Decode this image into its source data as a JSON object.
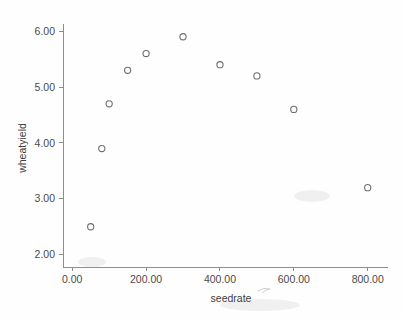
{
  "chart_data": {
    "type": "scatter",
    "title": "",
    "xlabel": "seedrate",
    "ylabel": "wheatyield",
    "x": [
      50,
      80,
      100,
      150,
      200,
      300,
      400,
      500,
      600,
      800
    ],
    "y": [
      2.5,
      3.9,
      4.7,
      5.3,
      5.6,
      5.9,
      5.4,
      5.2,
      4.6,
      3.2
    ],
    "points": [
      {
        "x": 50,
        "y": 2.5
      },
      {
        "x": 80,
        "y": 3.9
      },
      {
        "x": 100,
        "y": 4.7
      },
      {
        "x": 150,
        "y": 5.3
      },
      {
        "x": 200,
        "y": 5.6
      },
      {
        "x": 300,
        "y": 5.9
      },
      {
        "x": 400,
        "y": 5.4
      },
      {
        "x": 500,
        "y": 5.2
      },
      {
        "x": 600,
        "y": 4.6
      },
      {
        "x": 800,
        "y": 3.2
      }
    ],
    "xlim": [
      -25,
      855
    ],
    "ylim": [
      1.78,
      6.2
    ],
    "xticks": [
      0,
      200,
      400,
      600,
      800
    ],
    "xtick_labels": [
      "0.00",
      "200.00",
      "400.00",
      "600.00",
      "800.00"
    ],
    "yticks": [
      2,
      3,
      4,
      5,
      6
    ],
    "ytick_labels": [
      "2.00",
      "3.00",
      "4.00",
      "5.00",
      "6.00"
    ],
    "grid": false,
    "legend": null,
    "marker": "open-circle",
    "marker_color": "#6f6f6f",
    "axis_color": "#8e8e8e",
    "background_color": "#fefefe"
  }
}
